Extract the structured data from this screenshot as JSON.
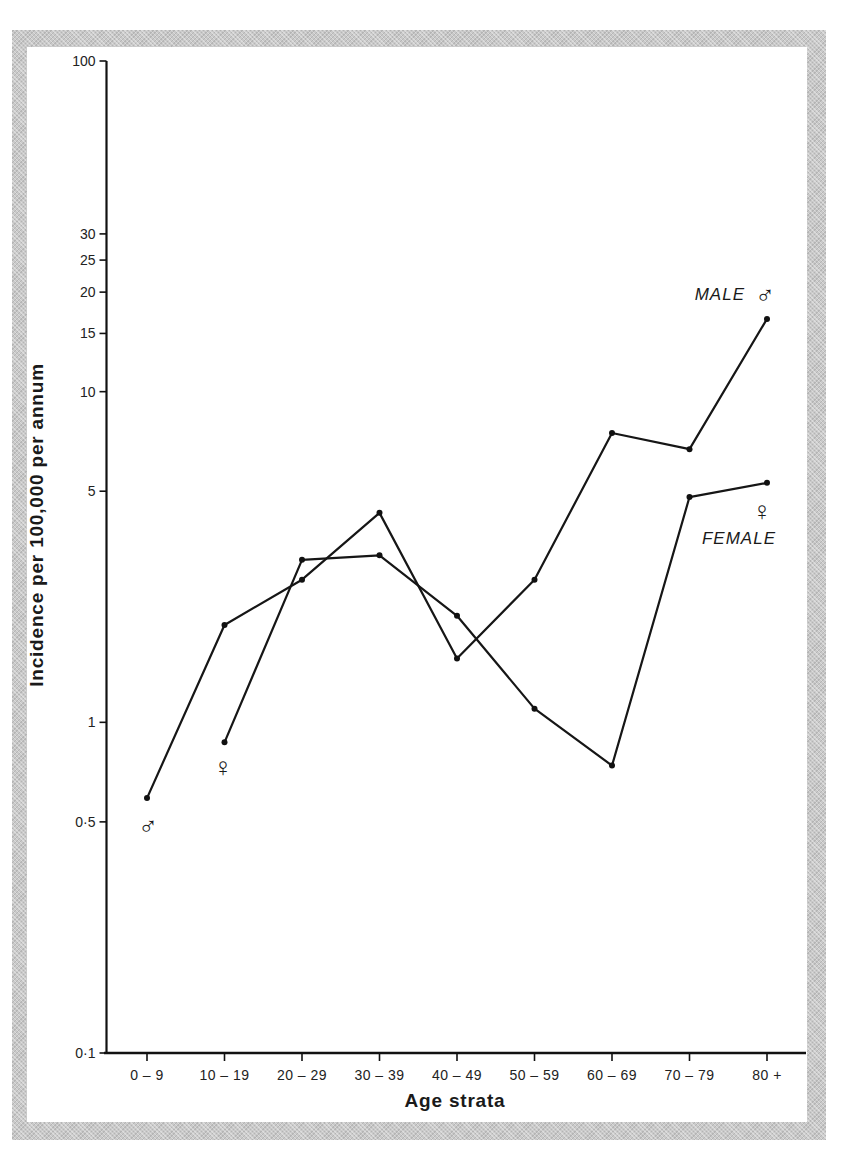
{
  "chart_data": {
    "type": "line",
    "title": "",
    "xlabel": "Age strata",
    "ylabel": "Incidence per 100,000 per annum",
    "yscale": "log",
    "ylim": [
      0.1,
      100
    ],
    "yticks": [
      {
        "value": 100,
        "label": "100"
      },
      {
        "value": 30,
        "label": "30"
      },
      {
        "value": 25,
        "label": "25"
      },
      {
        "value": 20,
        "label": "20"
      },
      {
        "value": 15,
        "label": "15"
      },
      {
        "value": 10,
        "label": "10"
      },
      {
        "value": 5,
        "label": "5"
      },
      {
        "value": 1,
        "label": "1"
      },
      {
        "value": 0.5,
        "label": "0·5"
      },
      {
        "value": 0.1,
        "label": "0·1"
      }
    ],
    "categories": [
      "0-9",
      "10-19",
      "20-29",
      "30-39",
      "40-49",
      "50-59",
      "60-69",
      "70-79",
      "80+"
    ],
    "category_labels": [
      "0 – 9",
      "10 – 19",
      "20 – 29",
      "30 – 39",
      "40 – 49",
      "50 – 59",
      "60 – 69",
      "70 – 79",
      "80 +"
    ],
    "grid": false,
    "legend_position": "inline-right",
    "series": [
      {
        "name": "MALE",
        "symbol": "♂",
        "values": [
          0.59,
          1.97,
          2.7,
          4.3,
          1.56,
          2.7,
          7.5,
          6.7,
          16.6
        ]
      },
      {
        "name": "FEMALE",
        "symbol": "♀",
        "values": [
          null,
          0.87,
          3.1,
          3.2,
          2.1,
          1.1,
          0.74,
          4.8,
          5.3
        ]
      }
    ],
    "annotations": [
      {
        "text": "♂",
        "near": "male series start (0-9)"
      },
      {
        "text": "♀",
        "near": "female series start (10-19)"
      },
      {
        "text": "MALE ♂",
        "near": "male series end (80+)"
      },
      {
        "text": "♀ FEMALE",
        "near": "female series end (80+)"
      }
    ]
  }
}
